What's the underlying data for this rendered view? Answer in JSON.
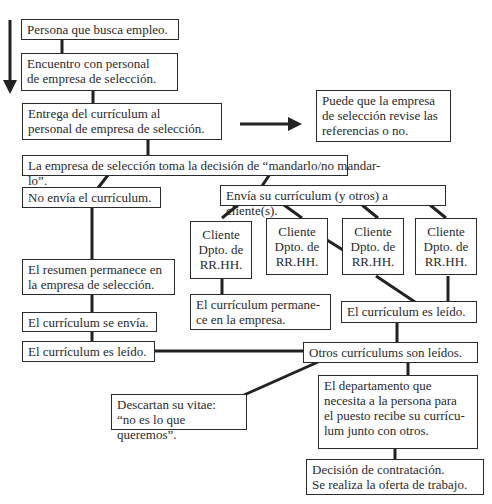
{
  "diagram": {
    "type": "flowchart",
    "nodes": {
      "n1": "Persona que busca empleo.",
      "n2": "Encuentro con personal\nde empresa de selección.",
      "n3": "Entrega del currículum al\npersonal de empresa de selección.",
      "n4": "Puede que la empresa\nde selección revise las\nreferencias o no.",
      "n5": "La empresa de selección toma la decisión de “mandarlo/no mandar-",
      "n5b": "lo”.",
      "n6": "No envía el currículum.",
      "n7": "Envía su currículum (y otros) a cliente(s).",
      "c1": "Cliente\nDpto. de\nRR.HH.",
      "c2": "Cliente\nDpto. de\nRR.HH.",
      "c3": "Cliente\nDpto. de\nRR.HH.",
      "c4": "Cliente\nDpto. de\nRR.HH.",
      "n8": "El resumen permanece en\nla empresa de selección.",
      "n9": "El currículum permane-\nce en la empresa.",
      "n10": "El currículum es leído.",
      "n11": "El currículum se envía.",
      "n12": "El currículum es leído.",
      "n13": "Otros currículums son leídos.",
      "n14": "Descartan su vitae:\n“no es lo que queremos”.",
      "n15": "El departamento que\nnecesita a la persona para\nel puesto recibe su currícu-\nlum junto con otros.",
      "n16": "Decisión de contratación.\nSe realiza la oferta de trabajo."
    }
  }
}
